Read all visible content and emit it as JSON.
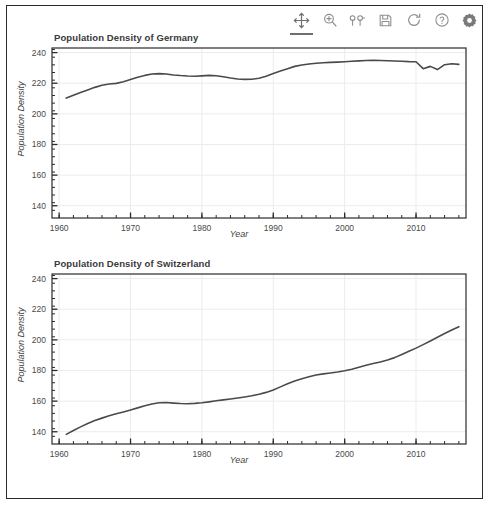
{
  "window": {
    "background": "#ffffff",
    "border_color": "#2b2b2b"
  },
  "toolbar": {
    "items": [
      {
        "name": "pan-icon",
        "label": "Pan/Move",
        "active": true
      },
      {
        "name": "zoom-icon",
        "label": "Zoom",
        "active": false
      },
      {
        "name": "axes-icon",
        "label": "Configure axes",
        "active": false
      },
      {
        "name": "save-icon",
        "label": "Save figure",
        "active": false
      },
      {
        "name": "refresh-icon",
        "label": "Reset view",
        "active": false
      },
      {
        "name": "help-icon",
        "label": "Help",
        "active": false
      },
      {
        "name": "gear-icon",
        "label": "Settings",
        "active": false
      }
    ]
  },
  "style": {
    "line_color": "#4a4a4a",
    "grid_color": "#ececec",
    "axis_color": "#2b2b2b",
    "tick_text_color": "#4a4a4a"
  },
  "chart_data": [
    {
      "id": "germany",
      "type": "line",
      "title": "Population Density of Germany",
      "xlabel": "Year",
      "ylabel": "Population Density",
      "xlim": [
        1959,
        2017
      ],
      "ylim": [
        132,
        243
      ],
      "xticks": [
        1960,
        1970,
        1980,
        1990,
        2000,
        2010
      ],
      "yticks": [
        140,
        160,
        180,
        200,
        220,
        240
      ],
      "minor_xtick_step": 2,
      "minor_ytick_step": 5,
      "grid": true,
      "legend": "none",
      "x": [
        1961,
        1962,
        1963,
        1964,
        1965,
        1966,
        1967,
        1968,
        1969,
        1970,
        1971,
        1972,
        1973,
        1974,
        1975,
        1976,
        1977,
        1978,
        1979,
        1980,
        1981,
        1982,
        1983,
        1984,
        1985,
        1986,
        1987,
        1988,
        1989,
        1990,
        1991,
        1992,
        1993,
        1994,
        1995,
        1996,
        1997,
        1998,
        1999,
        2000,
        2001,
        2002,
        2003,
        2004,
        2005,
        2006,
        2007,
        2008,
        2009,
        2010,
        2011,
        2012,
        2013,
        2014,
        2015,
        2016
      ],
      "y": [
        210.3,
        212.2,
        214.0,
        215.6,
        217.3,
        218.7,
        219.5,
        219.9,
        221.0,
        222.4,
        223.9,
        225.1,
        226.0,
        226.3,
        226.0,
        225.4,
        225.0,
        224.7,
        224.6,
        224.8,
        225.1,
        224.9,
        224.2,
        223.4,
        222.8,
        222.5,
        222.6,
        223.3,
        224.6,
        226.3,
        228.0,
        229.5,
        231.0,
        231.9,
        232.5,
        233.0,
        233.4,
        233.6,
        233.8,
        234.0,
        234.3,
        234.6,
        234.8,
        234.9,
        234.8,
        234.7,
        234.5,
        234.3,
        234.1,
        234.0,
        229.5,
        231.0,
        228.9,
        232.1,
        232.7,
        232.3
      ]
    },
    {
      "id": "switzerland",
      "type": "line",
      "title": "Population Density of Switzerland",
      "xlabel": "Year",
      "ylabel": "Population Density",
      "xlim": [
        1959,
        2017
      ],
      "ylim": [
        132,
        243
      ],
      "xticks": [
        1960,
        1970,
        1980,
        1990,
        2000,
        2010
      ],
      "yticks": [
        140,
        160,
        180,
        200,
        220,
        240
      ],
      "minor_xtick_step": 2,
      "minor_ytick_step": 5,
      "grid": true,
      "legend": "none",
      "x": [
        1961,
        1962,
        1963,
        1964,
        1965,
        1966,
        1967,
        1968,
        1969,
        1970,
        1971,
        1972,
        1973,
        1974,
        1975,
        1976,
        1977,
        1978,
        1979,
        1980,
        1981,
        1982,
        1983,
        1984,
        1985,
        1986,
        1987,
        1988,
        1989,
        1990,
        1991,
        1992,
        1993,
        1994,
        1995,
        1996,
        1997,
        1998,
        1999,
        2000,
        2001,
        2002,
        2003,
        2004,
        2005,
        2006,
        2007,
        2008,
        2009,
        2010,
        2011,
        2012,
        2013,
        2014,
        2015,
        2016
      ],
      "y": [
        138.3,
        140.8,
        143.2,
        145.4,
        147.3,
        148.9,
        150.4,
        151.7,
        152.9,
        154.2,
        155.6,
        157.0,
        158.1,
        158.9,
        159.1,
        158.7,
        158.4,
        158.3,
        158.5,
        158.9,
        159.5,
        160.2,
        160.8,
        161.4,
        162.0,
        162.7,
        163.5,
        164.5,
        165.7,
        167.2,
        169.3,
        171.3,
        173.1,
        174.6,
        175.9,
        177.0,
        177.8,
        178.4,
        179.0,
        179.8,
        180.8,
        182.1,
        183.4,
        184.5,
        185.6,
        186.8,
        188.4,
        190.4,
        192.5,
        194.6,
        196.9,
        199.3,
        201.7,
        204.1,
        206.4,
        208.6
      ]
    }
  ]
}
